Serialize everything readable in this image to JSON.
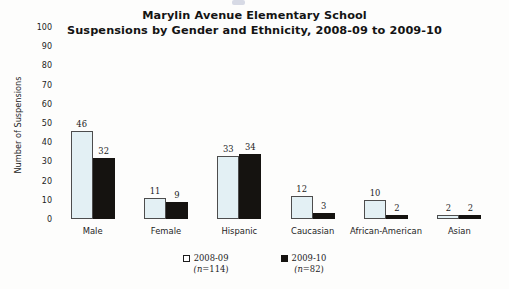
{
  "chart_data": {
    "type": "bar",
    "title": "Marylin Avenue Elementary School\nSuspensions by Gender and Ethnicity, 2008-09 to 2009-10",
    "title_line1": "Marylin Avenue Elementary School",
    "title_line2": "Suspensions by Gender and Ethnicity, 2008-09 to 2009-10",
    "xlabel": "",
    "ylabel": "Number of Suspensions",
    "ylim": [
      0,
      100
    ],
    "ytick_step": 10,
    "yticks": [
      "100",
      "90",
      "80",
      "70",
      "60",
      "50",
      "40",
      "30",
      "20",
      "10",
      "0"
    ],
    "grid": false,
    "legend_position": "bottom-center",
    "categories": [
      "Male",
      "Female",
      "Hispanic",
      "Caucasian",
      "African-American",
      "Asian"
    ],
    "series": [
      {
        "name": "2008-09",
        "n_label": "(n=114)",
        "n_prefix": "(n",
        "n_value": "=114)",
        "color": "#e3f0f4",
        "edge_color": "#4d4d4d",
        "values": [
          46,
          11,
          33,
          12,
          10,
          2
        ]
      },
      {
        "name": "2009-10",
        "n_label": "(n=82)",
        "n_prefix": "(n",
        "n_value": "=82)",
        "color": "#151310",
        "edge_color": "#151310",
        "values": [
          32,
          9,
          34,
          3,
          2,
          2
        ]
      }
    ]
  }
}
